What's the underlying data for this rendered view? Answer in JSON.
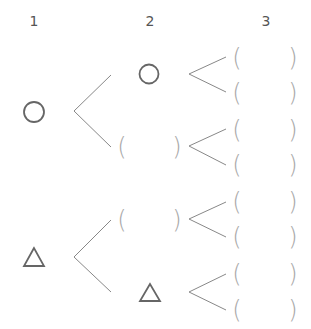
{
  "diagram": {
    "type": "tree",
    "headers": [
      {
        "label": "1",
        "x": 34
      },
      {
        "label": "2",
        "x": 150
      },
      {
        "label": "3",
        "x": 266
      }
    ],
    "colors": {
      "symbol": "#666666",
      "line": "#888888",
      "paren": "#a8a8a8",
      "header": "#555555"
    },
    "level1": [
      {
        "symbol": "circle",
        "y": 112
      },
      {
        "symbol": "triangle",
        "y": 257
      }
    ],
    "level2": [
      {
        "symbol": "circle",
        "y": 74
      },
      {
        "symbol": "blank",
        "y": 147
      },
      {
        "symbol": "blank",
        "y": 220
      },
      {
        "symbol": "triangle",
        "y": 293
      }
    ],
    "level3": [
      {
        "symbol": "blank",
        "y": 58
      },
      {
        "symbol": "blank",
        "y": 93
      },
      {
        "symbol": "blank",
        "y": 130
      },
      {
        "symbol": "blank",
        "y": 165
      },
      {
        "symbol": "blank",
        "y": 202
      },
      {
        "symbol": "blank",
        "y": 237
      },
      {
        "symbol": "blank",
        "y": 274
      },
      {
        "symbol": "blank",
        "y": 310
      }
    ],
    "paren_open": "(",
    "paren_close": ")"
  }
}
